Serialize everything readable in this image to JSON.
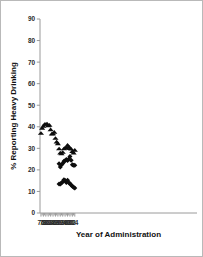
{
  "figure": {
    "background_color": "#ffffff",
    "border_color": "#b9b9b9",
    "marker_color": "#0d0d0d",
    "axis_color": "#9a9a9a"
  },
  "chart_data": {
    "type": "scatter",
    "title": "",
    "xlabel": "Year of Administration",
    "ylabel": "% Reporting Heavy Drinking",
    "xlim": [
      75.2,
      205.2
    ],
    "ylim": [
      0,
      90
    ],
    "grid": false,
    "legend": "none",
    "yticks": [
      0,
      10,
      20,
      30,
      40,
      50,
      60,
      70,
      80,
      90
    ],
    "ytick_labels": [
      "0",
      "10",
      "20",
      "30",
      "40",
      "50",
      "60",
      "70",
      "80",
      "90"
    ],
    "xticks": [
      76,
      78,
      80,
      82,
      84,
      86,
      88,
      90,
      92,
      94,
      96,
      98,
      100,
      102,
      104
    ],
    "xtick_labels": [
      "76",
      "78",
      "80",
      "82",
      "84",
      "86",
      "88",
      "90",
      "92",
      "94",
      "96",
      "98",
      "00",
      "02",
      "04"
    ],
    "xtick_minor": [
      77,
      79,
      81,
      83,
      85,
      87,
      89,
      91,
      93,
      95,
      97,
      99,
      101,
      103
    ],
    "series": [
      {
        "name": "series-triangles",
        "marker": "triangle",
        "x": [
          76,
          77,
          78,
          79,
          80,
          81,
          82,
          83,
          84,
          85,
          86,
          87,
          88,
          89,
          90,
          91,
          92,
          93,
          94,
          95,
          96,
          97,
          98,
          99,
          100,
          101,
          102,
          103,
          104
        ],
        "values": [
          37.0,
          39.4,
          40.3,
          41.2,
          41.2,
          41.4,
          40.5,
          40.8,
          38.7,
          36.7,
          36.8,
          37.5,
          34.7,
          33.0,
          32.2,
          29.8,
          27.9,
          27.5,
          28.2,
          29.8,
          30.2,
          30.2,
          31.5,
          30.8,
          30.0,
          29.7,
          28.6,
          27.9,
          29.2
        ]
      },
      {
        "name": "series-diamonds-middle",
        "marker": "diamond",
        "x": [
          91,
          92,
          93,
          94,
          95,
          96,
          97,
          98,
          99,
          100,
          101,
          102,
          103,
          104
        ],
        "values": [
          22.9,
          21.3,
          22.4,
          23.0,
          24.0,
          24.2,
          24.8,
          24.3,
          25.1,
          26.2,
          24.5,
          22.4,
          22.1,
          22.1
        ]
      },
      {
        "name": "series-diamonds-lower",
        "marker": "diamond",
        "x": [
          91,
          92,
          93,
          94,
          95,
          96,
          97,
          98,
          99,
          100,
          101,
          102,
          103,
          104
        ],
        "values": [
          13.4,
          13.5,
          13.9,
          14.5,
          15.4,
          15.1,
          14.1,
          15.2,
          14.0,
          13.7,
          13.0,
          12.4,
          11.9,
          11.6
        ]
      }
    ]
  }
}
